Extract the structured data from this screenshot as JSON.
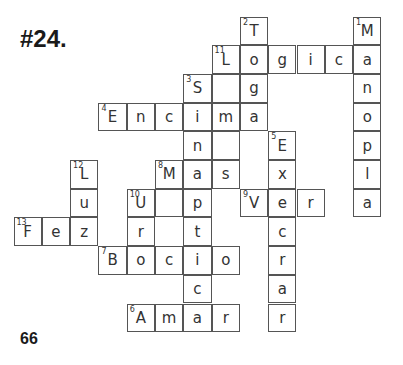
{
  "title": "#24.",
  "page_number": "66",
  "grid": {
    "origin_x": 14,
    "origin_y": 17,
    "cell_w": 28.3,
    "cell_h": 28.7,
    "cells": [
      {
        "r": 0,
        "c": 8,
        "letter": "T",
        "num": "2"
      },
      {
        "r": 0,
        "c": 12,
        "letter": "M",
        "num": "1"
      },
      {
        "r": 1,
        "c": 7,
        "letter": "L",
        "num": "11"
      },
      {
        "r": 1,
        "c": 8,
        "letter": "o"
      },
      {
        "r": 1,
        "c": 9,
        "letter": "g"
      },
      {
        "r": 1,
        "c": 10,
        "letter": "i"
      },
      {
        "r": 1,
        "c": 11,
        "letter": "c"
      },
      {
        "r": 1,
        "c": 12,
        "letter": "a"
      },
      {
        "r": 2,
        "c": 6,
        "letter": "S",
        "num": "3"
      },
      {
        "r": 2,
        "c": 7,
        "letter": ""
      },
      {
        "r": 2,
        "c": 8,
        "letter": "g"
      },
      {
        "r": 2,
        "c": 12,
        "letter": "n"
      },
      {
        "r": 3,
        "c": 3,
        "letter": "E",
        "num": "4"
      },
      {
        "r": 3,
        "c": 4,
        "letter": "n"
      },
      {
        "r": 3,
        "c": 5,
        "letter": "c"
      },
      {
        "r": 3,
        "c": 6,
        "letter": "i"
      },
      {
        "r": 3,
        "c": 7,
        "letter": "m"
      },
      {
        "r": 3,
        "c": 8,
        "letter": "a"
      },
      {
        "r": 3,
        "c": 12,
        "letter": "o"
      },
      {
        "r": 4,
        "c": 6,
        "letter": "n"
      },
      {
        "r": 4,
        "c": 7,
        "letter": ""
      },
      {
        "r": 4,
        "c": 9,
        "letter": "E",
        "num": "5"
      },
      {
        "r": 4,
        "c": 12,
        "letter": "p"
      },
      {
        "r": 5,
        "c": 2,
        "letter": "L",
        "num": "12"
      },
      {
        "r": 5,
        "c": 5,
        "letter": "M",
        "num": "8"
      },
      {
        "r": 5,
        "c": 6,
        "letter": "a"
      },
      {
        "r": 5,
        "c": 7,
        "letter": "s"
      },
      {
        "r": 5,
        "c": 9,
        "letter": "x"
      },
      {
        "r": 5,
        "c": 12,
        "letter": "l"
      },
      {
        "r": 6,
        "c": 2,
        "letter": "u"
      },
      {
        "r": 6,
        "c": 4,
        "letter": "U",
        "num": "10"
      },
      {
        "r": 6,
        "c": 5,
        "letter": ""
      },
      {
        "r": 6,
        "c": 6,
        "letter": "p"
      },
      {
        "r": 6,
        "c": 8,
        "letter": "V",
        "num": "9"
      },
      {
        "r": 6,
        "c": 9,
        "letter": "e"
      },
      {
        "r": 6,
        "c": 10,
        "letter": "r"
      },
      {
        "r": 6,
        "c": 12,
        "letter": "a"
      },
      {
        "r": 7,
        "c": 0,
        "letter": "F",
        "num": "13"
      },
      {
        "r": 7,
        "c": 1,
        "letter": "e"
      },
      {
        "r": 7,
        "c": 2,
        "letter": "z"
      },
      {
        "r": 7,
        "c": 4,
        "letter": "r"
      },
      {
        "r": 7,
        "c": 6,
        "letter": "t"
      },
      {
        "r": 7,
        "c": 9,
        "letter": "c"
      },
      {
        "r": 8,
        "c": 3,
        "letter": "B",
        "num": "7"
      },
      {
        "r": 8,
        "c": 4,
        "letter": "o"
      },
      {
        "r": 8,
        "c": 5,
        "letter": "c"
      },
      {
        "r": 8,
        "c": 6,
        "letter": "i"
      },
      {
        "r": 8,
        "c": 7,
        "letter": "o"
      },
      {
        "r": 8,
        "c": 9,
        "letter": "r"
      },
      {
        "r": 9,
        "c": 6,
        "letter": "c"
      },
      {
        "r": 9,
        "c": 9,
        "letter": "a"
      },
      {
        "r": 10,
        "c": 4,
        "letter": "A",
        "num": "6"
      },
      {
        "r": 10,
        "c": 5,
        "letter": "m"
      },
      {
        "r": 10,
        "c": 6,
        "letter": "a"
      },
      {
        "r": 10,
        "c": 7,
        "letter": "r"
      },
      {
        "r": 10,
        "c": 9,
        "letter": "r"
      }
    ]
  },
  "words": {
    "across": [
      "Logica",
      "Encima",
      "Mas",
      "Ver",
      "Fez",
      "Bocio",
      "Amar"
    ],
    "down": [
      "Manopla",
      "Toga",
      "Sinaptica",
      "Execrar",
      "Luz",
      "Ur"
    ]
  }
}
